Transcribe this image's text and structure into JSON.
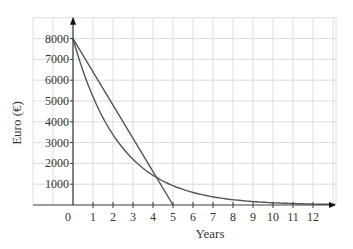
{
  "chart_data": {
    "type": "line",
    "title": "",
    "xlabel": "Years",
    "ylabel": "Euro (€)",
    "xlim": [
      -2,
      13.15
    ],
    "ylim": [
      0,
      9000
    ],
    "grid": true,
    "legend": null,
    "x_ticks": [
      0,
      1,
      2,
      3,
      4,
      5,
      6,
      7,
      8,
      9,
      10,
      11,
      12
    ],
    "x_tick_labels": [
      "0",
      "1",
      "2",
      "3",
      "4",
      "5",
      "6",
      "7",
      "8",
      "9",
      "10",
      "11",
      "12"
    ],
    "y_ticks": [
      1000,
      2000,
      3000,
      4000,
      5000,
      6000,
      7000,
      8000
    ],
    "y_tick_labels": [
      "1000",
      "2000",
      "3000",
      "4000",
      "5000",
      "6000",
      "7000",
      "8000"
    ],
    "series": [
      {
        "name": "Straight-line depreciation",
        "kind": "linear",
        "x": [
          0,
          1,
          2,
          3,
          4,
          5
        ],
        "values": [
          8000,
          6400,
          4800,
          3200,
          1600,
          0
        ]
      },
      {
        "name": "Reducing-balance depreciation",
        "kind": "exponential",
        "x": [
          0,
          1,
          2,
          3,
          4,
          5,
          6,
          7,
          8,
          9,
          10,
          11,
          12,
          13
        ],
        "values": [
          8000,
          5200,
          3380,
          2197,
          1428,
          928,
          603,
          392,
          255,
          166,
          108,
          70,
          45,
          30
        ]
      }
    ],
    "annotations": [
      "Lines intersect near x ≈ 4.2, y ≈ 1300"
    ]
  },
  "colors": {
    "grid": "#d4d4d4",
    "axis": "#3a3a3a",
    "series": "#555555",
    "text": "#333333"
  }
}
